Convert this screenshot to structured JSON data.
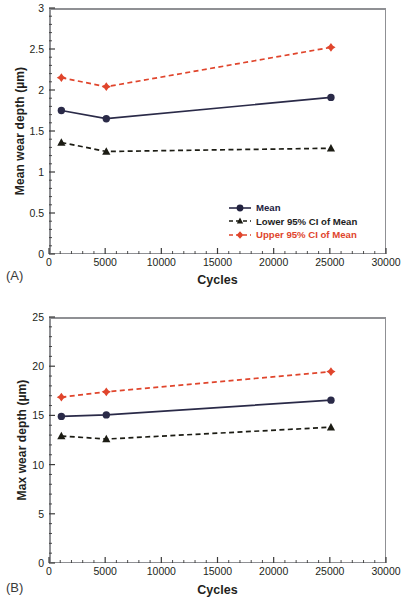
{
  "figure": {
    "panels": [
      {
        "tag": "(A)",
        "ylabel": "Mean wear depth (µm)",
        "xlabel": "Cycles",
        "yticks": [
          "0",
          "0.5",
          "1",
          "1.5",
          "2",
          "2.5",
          "3"
        ],
        "xticks": [
          "0",
          "5000",
          "10000",
          "15000",
          "20000",
          "25000",
          "30000"
        ]
      },
      {
        "tag": "(B)",
        "ylabel": "Max wear depth (µm)",
        "xlabel": "Cycles",
        "yticks": [
          "0",
          "5",
          "10",
          "15",
          "20",
          "25"
        ],
        "xticks": [
          "0",
          "5000",
          "10000",
          "15000",
          "20000",
          "25000",
          "30000"
        ]
      }
    ],
    "legend": {
      "mean": "Mean",
      "lower": "Lower 95% CI of Mean",
      "upper": "Upper 95% CI of Mean"
    },
    "colors": {
      "mean": "#2a2a48",
      "lower": "#1c1c14",
      "upper": "#e0452c",
      "frame": "#8f9094",
      "text": "#231f20"
    },
    "caption_fragment": ""
  },
  "chart_data": [
    {
      "type": "line",
      "title": "(A) Mean wear depth vs cycles",
      "xlabel": "Cycles",
      "ylabel": "Mean wear depth (µm)",
      "xlim": [
        0,
        30000
      ],
      "ylim": [
        0,
        3
      ],
      "xticks": [
        0,
        5000,
        10000,
        15000,
        20000,
        25000,
        30000
      ],
      "yticks": [
        0,
        0.5,
        1,
        1.5,
        2,
        2.5,
        3
      ],
      "minor_xtick_interval": 1000,
      "minor_ytick_interval": 0.1,
      "grid": false,
      "legend_position": "lower-right inside axes",
      "x": [
        1100,
        5100,
        25100
      ],
      "series": [
        {
          "name": "Mean",
          "values": [
            1.75,
            1.65,
            1.91
          ],
          "color": "#2a2a48",
          "linestyle": "solid",
          "marker": "circle"
        },
        {
          "name": "Lower 95% CI of Mean",
          "values": [
            1.36,
            1.25,
            1.29
          ],
          "color": "#1c1c14",
          "linestyle": "dashed",
          "marker": "triangle"
        },
        {
          "name": "Upper 95% CI of Mean",
          "values": [
            2.15,
            2.04,
            2.52
          ],
          "color": "#e0452c",
          "linestyle": "dashed",
          "marker": "diamond"
        }
      ]
    },
    {
      "type": "line",
      "title": "(B) Max wear depth vs cycles",
      "xlabel": "Cycles",
      "ylabel": "Max wear depth (µm)",
      "xlim": [
        0,
        30000
      ],
      "ylim": [
        0,
        25
      ],
      "xticks": [
        0,
        5000,
        10000,
        15000,
        20000,
        25000,
        30000
      ],
      "yticks": [
        0,
        5,
        10,
        15,
        20,
        25
      ],
      "minor_xtick_interval": 1000,
      "minor_ytick_interval": 1,
      "grid": false,
      "legend_position": "lower-right inside axes",
      "x": [
        1100,
        5100,
        25100
      ],
      "series": [
        {
          "name": "Mean",
          "values": [
            14.9,
            15.05,
            16.55
          ],
          "color": "#2a2a48",
          "linestyle": "solid",
          "marker": "circle"
        },
        {
          "name": "Lower 95% CI of Mean",
          "values": [
            12.9,
            12.6,
            13.8
          ],
          "color": "#1c1c14",
          "linestyle": "dashed",
          "marker": "triangle"
        },
        {
          "name": "Upper 95% CI of Mean",
          "values": [
            16.85,
            17.4,
            19.45
          ],
          "color": "#e0452c",
          "linestyle": "dashed",
          "marker": "diamond"
        }
      ]
    }
  ]
}
